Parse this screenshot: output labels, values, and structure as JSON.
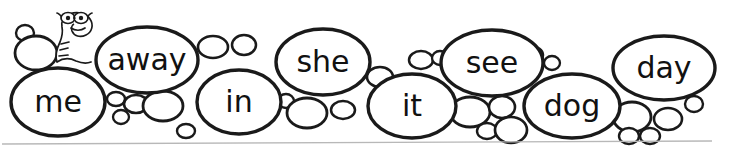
{
  "worksheet": {
    "title": "Sight Word Bubbles",
    "mascot": {
      "name": "bespectacled-snake-mascot",
      "description": "cartoon snake wearing glasses"
    },
    "baseline": {
      "x1": 2,
      "y1": 144,
      "x2": 712,
      "y2": 141,
      "color": "#b8b8b8"
    },
    "ink_color": "#1a1a1a",
    "paper_color": "#ffffff",
    "word_bubbles": [
      {
        "word": "me",
        "cx": 58,
        "cy": 102,
        "rx": 47,
        "ry": 34,
        "stroke": 3.4,
        "font_size": 30
      },
      {
        "word": "away",
        "cx": 147,
        "cy": 60,
        "rx": 51,
        "ry": 33,
        "stroke": 3.4,
        "font_size": 30
      },
      {
        "word": "in",
        "cx": 239,
        "cy": 102,
        "rx": 42,
        "ry": 32,
        "stroke": 3.4,
        "font_size": 30
      },
      {
        "word": "she",
        "cx": 323,
        "cy": 62,
        "rx": 47,
        "ry": 33,
        "stroke": 3.4,
        "font_size": 30
      },
      {
        "word": "it",
        "cx": 412,
        "cy": 106,
        "rx": 44,
        "ry": 32,
        "stroke": 3.4,
        "font_size": 30
      },
      {
        "word": "see",
        "cx": 492,
        "cy": 63,
        "rx": 51,
        "ry": 33,
        "stroke": 3.4,
        "font_size": 30
      },
      {
        "word": "dog",
        "cx": 572,
        "cy": 106,
        "rx": 48,
        "ry": 32,
        "stroke": 3.4,
        "font_size": 30
      },
      {
        "word": "day",
        "cx": 664,
        "cy": 68,
        "rx": 51,
        "ry": 32,
        "stroke": 3.4,
        "font_size": 30
      }
    ],
    "small_bubbles": [
      {
        "cx": 25,
        "cy": 33,
        "rx": 9,
        "ry": 8,
        "stroke": 2.4
      },
      {
        "cx": 36,
        "cy": 53,
        "rx": 21,
        "ry": 17,
        "stroke": 2.8
      },
      {
        "cx": 116,
        "cy": 99,
        "rx": 9,
        "ry": 7,
        "stroke": 2.4
      },
      {
        "cx": 136,
        "cy": 104,
        "rx": 12,
        "ry": 9,
        "stroke": 2.6
      },
      {
        "cx": 121,
        "cy": 117,
        "rx": 8,
        "ry": 7,
        "stroke": 2.3
      },
      {
        "cx": 163,
        "cy": 106,
        "rx": 20,
        "ry": 15,
        "stroke": 2.8
      },
      {
        "cx": 186,
        "cy": 131,
        "rx": 9,
        "ry": 7,
        "stroke": 2.4
      },
      {
        "cx": 213,
        "cy": 47,
        "rx": 15,
        "ry": 11,
        "stroke": 2.6
      },
      {
        "cx": 244,
        "cy": 45,
        "rx": 12,
        "ry": 10,
        "stroke": 2.5
      },
      {
        "cx": 286,
        "cy": 101,
        "rx": 8,
        "ry": 7,
        "stroke": 2.3
      },
      {
        "cx": 307,
        "cy": 113,
        "rx": 20,
        "ry": 15,
        "stroke": 2.8
      },
      {
        "cx": 343,
        "cy": 110,
        "rx": 12,
        "ry": 9,
        "stroke": 2.5
      },
      {
        "cx": 380,
        "cy": 77,
        "rx": 13,
        "ry": 10,
        "stroke": 2.6
      },
      {
        "cx": 402,
        "cy": 82,
        "rx": 8,
        "ry": 7,
        "stroke": 2.3
      },
      {
        "cx": 421,
        "cy": 60,
        "rx": 12,
        "ry": 9,
        "stroke": 2.5
      },
      {
        "cx": 440,
        "cy": 58,
        "rx": 8,
        "ry": 7,
        "stroke": 2.3
      },
      {
        "cx": 470,
        "cy": 112,
        "rx": 20,
        "ry": 15,
        "stroke": 2.8
      },
      {
        "cx": 502,
        "cy": 107,
        "rx": 13,
        "ry": 11,
        "stroke": 2.6
      },
      {
        "cx": 487,
        "cy": 131,
        "rx": 10,
        "ry": 8,
        "stroke": 2.4
      },
      {
        "cx": 511,
        "cy": 130,
        "rx": 16,
        "ry": 13,
        "stroke": 2.7
      },
      {
        "cx": 531,
        "cy": 55,
        "rx": 12,
        "ry": 9,
        "stroke": 2.5
      },
      {
        "cx": 552,
        "cy": 63,
        "rx": 8,
        "ry": 7,
        "stroke": 2.3
      },
      {
        "cx": 632,
        "cy": 117,
        "rx": 19,
        "ry": 15,
        "stroke": 2.8
      },
      {
        "cx": 668,
        "cy": 119,
        "rx": 14,
        "ry": 11,
        "stroke": 2.6
      },
      {
        "cx": 694,
        "cy": 104,
        "rx": 9,
        "ry": 8,
        "stroke": 2.4
      },
      {
        "cx": 629,
        "cy": 136,
        "rx": 10,
        "ry": 8,
        "stroke": 2.4
      },
      {
        "cx": 650,
        "cy": 136,
        "rx": 10,
        "ry": 8,
        "stroke": 2.4
      }
    ]
  }
}
